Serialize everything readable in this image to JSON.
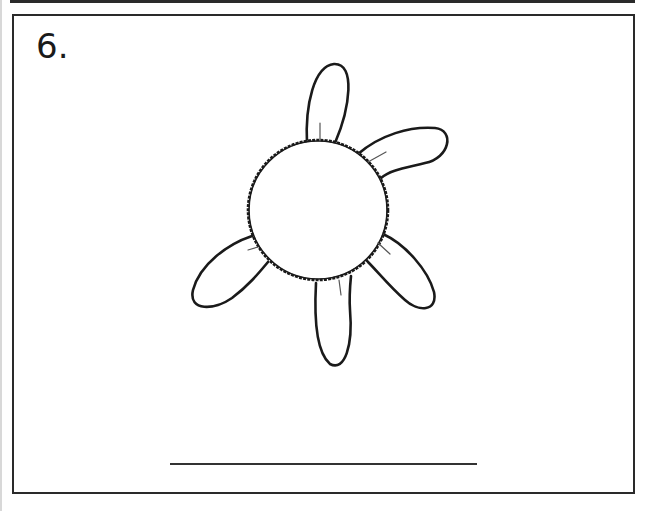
{
  "worksheet": {
    "problem_number": "6.",
    "figure": {
      "subject": "flower",
      "petal_count": 5,
      "center": {
        "cx": 318,
        "cy": 210,
        "r": 70
      },
      "stroke_color": "#1a1a1a"
    },
    "answer_line": {
      "value": ""
    }
  }
}
